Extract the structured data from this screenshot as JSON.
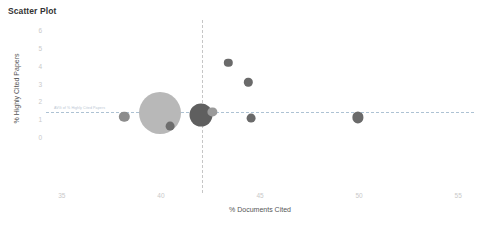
{
  "chart_data": {
    "type": "scatter",
    "title": "Scatter Plot",
    "xlabel": "% Documents Cited",
    "ylabel": "% Highly Cited Papers",
    "xlim": [
      34.2,
      55.8
    ],
    "ylim": [
      -0.45,
      6.3
    ],
    "xticks": [
      35,
      40,
      45,
      50,
      55
    ],
    "yticks": [
      0,
      1,
      2,
      3,
      4,
      5,
      6
    ],
    "grid": false,
    "legend": "none",
    "reference_lines": [
      {
        "orientation": "horizontal",
        "value": 1.42,
        "label": "AVG of % Highly Cited Papers",
        "color": "#9fb8cc",
        "style": "dashed"
      },
      {
        "orientation": "vertical",
        "value": 42.05,
        "label": "AVG of % Documents Cited",
        "color": "#c0c0c0",
        "style": "dashed"
      }
    ],
    "points": [
      {
        "x": 38.15,
        "y": 1.13,
        "size": 5.2,
        "color": "#8c8c8c"
      },
      {
        "x": 39.95,
        "y": 1.33,
        "size": 21.0,
        "color": "#b8b8b8"
      },
      {
        "x": 40.45,
        "y": 0.62,
        "size": 4.4,
        "color": "#6e6e6e"
      },
      {
        "x": 42.0,
        "y": 1.22,
        "size": 11.5,
        "color": "#5f5f5f"
      },
      {
        "x": 42.6,
        "y": 1.42,
        "size": 4.6,
        "color": "#9a9a9a"
      },
      {
        "x": 43.4,
        "y": 4.18,
        "size": 4.2,
        "color": "#6a6a6a"
      },
      {
        "x": 44.4,
        "y": 3.08,
        "size": 4.2,
        "color": "#6a6a6a"
      },
      {
        "x": 44.55,
        "y": 1.08,
        "size": 4.4,
        "color": "#6a6a6a"
      },
      {
        "x": 49.95,
        "y": 1.1,
        "size": 5.6,
        "color": "#6a6a6a"
      }
    ]
  }
}
